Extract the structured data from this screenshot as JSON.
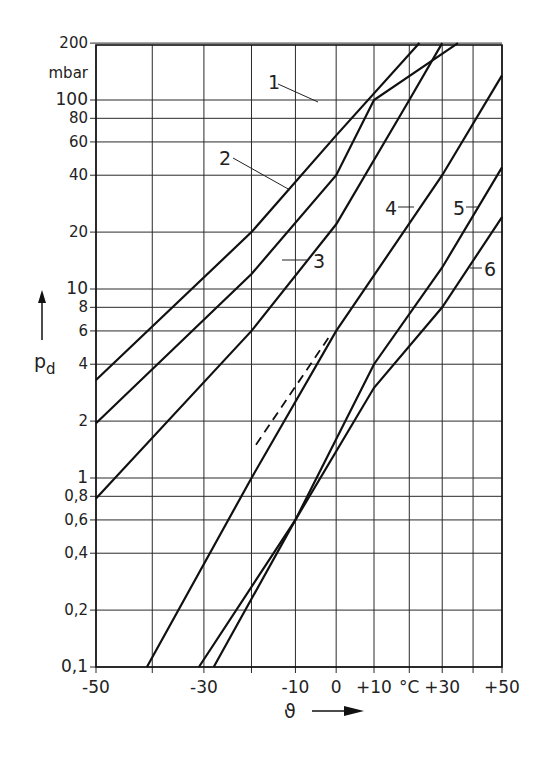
{
  "chart_data": {
    "type": "line",
    "title": "",
    "xlabel": "ϑ",
    "xunit": "°C",
    "ylabel": "p_d",
    "yunit": "mbar",
    "yscale": "log",
    "xscale": "reciprocal-temperature (non-linear)",
    "xlim": [
      -50,
      50
    ],
    "ylim": [
      0.1,
      200
    ],
    "grid": true,
    "x_ticks": [
      "-50",
      "-30",
      "-10",
      "0",
      "+10",
      "°C",
      "+30",
      "+50"
    ],
    "x_gridlines": [
      -50,
      -40,
      -30,
      -20,
      -10,
      0,
      10,
      20,
      30,
      40,
      50
    ],
    "y_ticks": [
      "200",
      "mbar",
      "100",
      "80",
      "60",
      "40",
      "20",
      "10",
      "8",
      "6",
      "4",
      "2",
      "1",
      "0,8",
      "0,6",
      "0,4",
      "0,2",
      "0,1"
    ],
    "y_gridlines": [
      200,
      100,
      80,
      60,
      40,
      20,
      10,
      8,
      6,
      4,
      2,
      1,
      0.8,
      0.6,
      0.4,
      0.2,
      0.1
    ],
    "series": [
      {
        "name": "1",
        "points": [
          {
            "x": -50,
            "y": 3.3
          },
          {
            "x": -20,
            "y": 20
          },
          {
            "x": 0,
            "y": 65
          },
          {
            "x": 23,
            "y": 200
          }
        ]
      },
      {
        "name": "2",
        "points": [
          {
            "x": -50,
            "y": 1.95
          },
          {
            "x": -20,
            "y": 12
          },
          {
            "x": 0,
            "y": 40
          },
          {
            "x": 10,
            "y": 100
          },
          {
            "x": 35,
            "y": 200
          }
        ]
      },
      {
        "name": "3",
        "points": [
          {
            "x": -50,
            "y": 0.78
          },
          {
            "x": -20,
            "y": 6
          },
          {
            "x": 0,
            "y": 22
          },
          {
            "x": 20,
            "y": 100
          },
          {
            "x": 30,
            "y": 200
          }
        ]
      },
      {
        "name": "4",
        "points": [
          {
            "x": -41,
            "y": 0.1
          },
          {
            "x": -20,
            "y": 1
          },
          {
            "x": 0,
            "y": 6
          },
          {
            "x": 30,
            "y": 40
          },
          {
            "x": 50,
            "y": 135
          }
        ]
      },
      {
        "name": "5",
        "points": [
          {
            "x": -31,
            "y": 0.1
          },
          {
            "x": -10,
            "y": 0.6
          },
          {
            "x": 10,
            "y": 4
          },
          {
            "x": 30,
            "y": 13
          },
          {
            "x": 50,
            "y": 44
          }
        ]
      },
      {
        "name": "6",
        "points": [
          {
            "x": -28,
            "y": 0.1
          },
          {
            "x": -10,
            "y": 0.6
          },
          {
            "x": 10,
            "y": 3
          },
          {
            "x": 30,
            "y": 8
          },
          {
            "x": 50,
            "y": 24
          }
        ]
      },
      {
        "name": "4 (dashed extension)",
        "style": "dashed",
        "points": [
          {
            "x": -19,
            "y": 1.5
          },
          {
            "x": -2,
            "y": 5.5
          }
        ]
      }
    ],
    "curve_labels": [
      "1",
      "2",
      "3",
      "4",
      "5",
      "6"
    ]
  },
  "axes": {
    "y_unit": "mbar",
    "y_symbol": "p",
    "y_symbol_sub": "d",
    "x_symbol": "ϑ"
  }
}
